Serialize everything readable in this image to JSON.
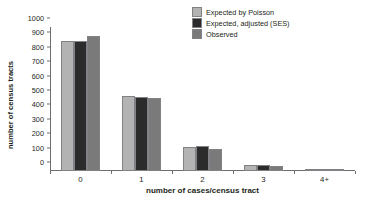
{
  "chart_data": {
    "type": "bar",
    "title": "",
    "xlabel": "number of cases/census tract",
    "ylabel": "number of census tracts",
    "categories": [
      "0",
      "1",
      "2",
      "3",
      "4+"
    ],
    "series": [
      {
        "name": "Expected by Poisson",
        "color": "#b3b3b3",
        "values": [
          900,
          518,
          170,
          42,
          6
        ]
      },
      {
        "name": "Expected, adjusted (SES)",
        "color": "#2b2b2b",
        "values": [
          900,
          517,
          172,
          42,
          6
        ]
      },
      {
        "name": "Observed",
        "color": "#7a7a7a",
        "values": [
          940,
          505,
          155,
          34,
          5
        ]
      }
    ],
    "ylim": [
      0,
      1000
    ],
    "yticks": [
      0,
      100,
      200,
      300,
      400,
      500,
      600,
      700,
      800,
      900,
      1000
    ],
    "ytick_labels": [
      "0",
      "100",
      "200",
      "300",
      "400",
      "500",
      "600",
      "700",
      "800",
      "900",
      "1000"
    ],
    "grid": false,
    "legend_position": "top-right"
  },
  "legend": {
    "items": [
      {
        "label": "Expected by Poisson",
        "color": "#b3b3b3"
      },
      {
        "label": "Expected, adjusted (SES)",
        "color": "#2b2b2b"
      },
      {
        "label": "Observed",
        "color": "#7a7a7a"
      }
    ]
  },
  "axes": {
    "x_title": "number of cases/census tract",
    "y_title": "number of census tracts"
  }
}
